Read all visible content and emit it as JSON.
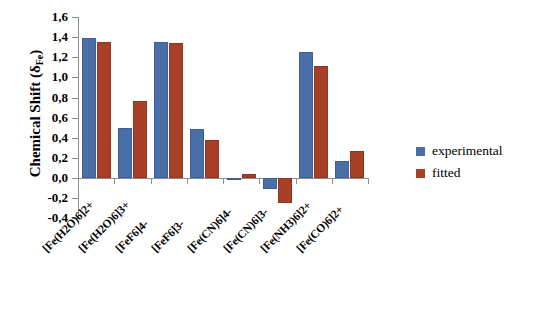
{
  "chart_data": {
    "type": "bar",
    "title": "",
    "xlabel": "",
    "ylabel": "Chemical Shift (δFe)",
    "ylabel_main": "Chemical Shift (δ",
    "ylabel_sub": "Fe",
    "ylabel_end": ")",
    "ylim": [
      -0.4,
      1.6
    ],
    "ytick_step": 0.2,
    "decimal_separator": ",",
    "grid": false,
    "legend_position": "right",
    "categories": [
      "[Fe(H2O)6]2+",
      "[Fe(H2O)6]3+",
      "[FeF6]4-",
      "[FeF6]3-",
      "[Fe(CN)6]4-",
      "[Fe(CN)6]3-",
      "[Fe(NH3)6]2+",
      "[Fe(CO)6]2+"
    ],
    "series": [
      {
        "name": "experimental",
        "color": "#4a6fa8",
        "values": [
          1.39,
          0.5,
          1.35,
          0.49,
          -0.01,
          -0.11,
          1.25,
          0.17
        ]
      },
      {
        "name": "fitted",
        "color": "#a84028",
        "values": [
          1.35,
          0.77,
          1.34,
          0.38,
          0.04,
          -0.25,
          1.11,
          0.27
        ]
      }
    ],
    "ytick_labels": [
      "1,6",
      "1,4",
      "1,2",
      "1,0",
      "0,8",
      "0,6",
      "0,4",
      "0,2",
      "0,0",
      "-0,2",
      "-0,4"
    ],
    "ytick_values": [
      1.6,
      1.4,
      1.2,
      1.0,
      0.8,
      0.6,
      0.4,
      0.2,
      0.0,
      -0.2,
      -0.4
    ]
  },
  "legend": {
    "entries": [
      {
        "label": "experimental",
        "color": "#4a6fa8"
      },
      {
        "label": "fitted",
        "color": "#a84028"
      }
    ]
  },
  "colors": {
    "experimental": "#4a6fa8",
    "fitted": "#a84028",
    "axis": "#8d8d8d",
    "text": "#000000",
    "background": "#ffffff"
  }
}
